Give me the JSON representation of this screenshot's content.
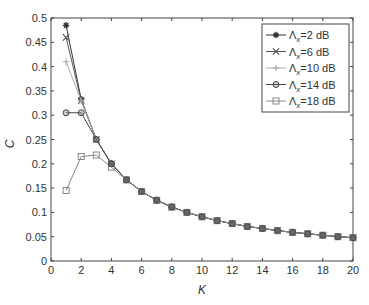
{
  "chart_data": {
    "type": "line",
    "title": "",
    "xlabel": "K",
    "ylabel": "C",
    "xlim": [
      0,
      20
    ],
    "ylim": [
      0,
      0.5
    ],
    "xticks": [
      0,
      2,
      4,
      6,
      8,
      10,
      12,
      14,
      16,
      18,
      20
    ],
    "yticks": [
      0,
      0.05,
      0.1,
      0.15,
      0.2,
      0.25,
      0.3,
      0.35,
      0.4,
      0.45,
      0.5
    ],
    "grid": false,
    "legend_position": "upper right",
    "x": [
      1,
      2,
      3,
      4,
      5,
      6,
      7,
      8,
      9,
      10,
      11,
      12,
      13,
      14,
      15,
      16,
      17,
      18,
      19,
      20
    ],
    "series": [
      {
        "name": "Λx=2 dB",
        "marker": "asterisk",
        "color": "#333333",
        "values": [
          0.485,
          0.333,
          0.25,
          0.2,
          0.167,
          0.143,
          0.125,
          0.111,
          0.1,
          0.091,
          0.083,
          0.077,
          0.071,
          0.067,
          0.0625,
          0.059,
          0.056,
          0.053,
          0.05,
          0.048
        ]
      },
      {
        "name": "Λx=6 dB",
        "marker": "x",
        "color": "#555555",
        "values": [
          0.46,
          0.33,
          0.25,
          0.2,
          0.167,
          0.143,
          0.125,
          0.111,
          0.1,
          0.091,
          0.083,
          0.077,
          0.071,
          0.067,
          0.0625,
          0.059,
          0.056,
          0.053,
          0.05,
          0.048
        ]
      },
      {
        "name": "Λx=10 dB",
        "marker": "plus",
        "color": "#aaaaaa",
        "values": [
          0.41,
          0.33,
          0.25,
          0.2,
          0.167,
          0.143,
          0.125,
          0.111,
          0.1,
          0.091,
          0.083,
          0.077,
          0.071,
          0.067,
          0.0625,
          0.059,
          0.056,
          0.053,
          0.05,
          0.048
        ]
      },
      {
        "name": "Λx=14 dB",
        "marker": "circle",
        "color": "#444444",
        "values": [
          0.305,
          0.305,
          0.25,
          0.2,
          0.167,
          0.143,
          0.125,
          0.111,
          0.1,
          0.091,
          0.083,
          0.077,
          0.071,
          0.067,
          0.0625,
          0.059,
          0.056,
          0.053,
          0.05,
          0.048
        ]
      },
      {
        "name": "Λx=18 dB",
        "marker": "square",
        "color": "#888888",
        "values": [
          0.145,
          0.215,
          0.218,
          0.193,
          0.167,
          0.143,
          0.125,
          0.111,
          0.1,
          0.091,
          0.083,
          0.077,
          0.071,
          0.067,
          0.0625,
          0.059,
          0.056,
          0.053,
          0.05,
          0.048
        ]
      }
    ]
  },
  "legend": {
    "items": [
      {
        "label": "Λ",
        "sub": "x",
        "suffix": "=2 dB"
      },
      {
        "label": "Λ",
        "sub": "x",
        "suffix": "=6 dB"
      },
      {
        "label": "Λ",
        "sub": "x",
        "suffix": "=10 dB"
      },
      {
        "label": "Λ",
        "sub": "x",
        "suffix": "=14 dB"
      },
      {
        "label": "Λ",
        "sub": "x",
        "suffix": "=18 dB"
      }
    ]
  }
}
